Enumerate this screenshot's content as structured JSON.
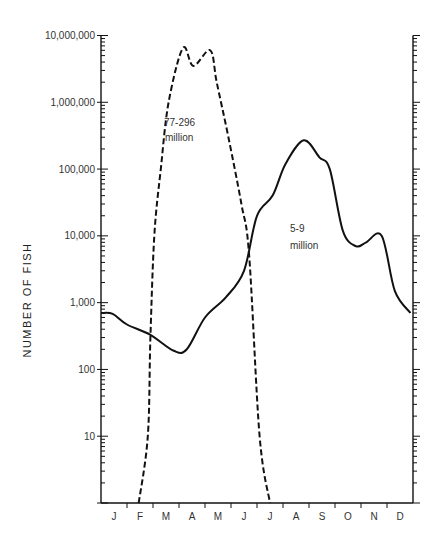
{
  "chart_data": {
    "type": "line",
    "title": "",
    "xlabel": "",
    "ylabel": "NUMBER OF FISH",
    "yscale": "log",
    "ylim": [
      1,
      10000000
    ],
    "y_ticks": [
      "10",
      "100",
      "1,000",
      "10,000",
      "100,000",
      "1,000,000",
      "10,000,000"
    ],
    "x_ticks": [
      "J",
      "F",
      "M",
      "A",
      "M",
      "J",
      "J",
      "A",
      "S",
      "O",
      "N",
      "D"
    ],
    "grid": false,
    "legend": null,
    "annotations": [
      {
        "text_line1": "77-296",
        "text_line2": "million",
        "series": "dashed"
      },
      {
        "text_line1": "5-9",
        "text_line2": "million",
        "series": "solid"
      }
    ],
    "series": [
      {
        "name": "77-296 million (dashed)",
        "style": "dashed",
        "points": [
          {
            "month": 1.45,
            "value": 1
          },
          {
            "month": 1.8,
            "value": 10
          },
          {
            "month": 1.9,
            "value": 300
          },
          {
            "month": 2.05,
            "value": 10000
          },
          {
            "month": 2.3,
            "value": 100000
          },
          {
            "month": 2.6,
            "value": 1000000
          },
          {
            "month": 3.15,
            "value": 6500000
          },
          {
            "month": 3.55,
            "value": 3500000
          },
          {
            "month": 4.2,
            "value": 6000000
          },
          {
            "month": 4.45,
            "value": 2000000
          },
          {
            "month": 4.9,
            "value": 300000
          },
          {
            "month": 5.4,
            "value": 30000
          },
          {
            "month": 5.7,
            "value": 5000
          },
          {
            "month": 6.1,
            "value": 10
          },
          {
            "month": 6.5,
            "value": 1
          }
        ]
      },
      {
        "name": "5-9 million (solid)",
        "style": "solid",
        "points": [
          {
            "month": 0.0,
            "value": 700
          },
          {
            "month": 0.45,
            "value": 680
          },
          {
            "month": 1.0,
            "value": 470
          },
          {
            "month": 1.9,
            "value": 330
          },
          {
            "month": 2.8,
            "value": 190
          },
          {
            "month": 3.3,
            "value": 200
          },
          {
            "month": 4.0,
            "value": 600
          },
          {
            "month": 4.8,
            "value": 1200
          },
          {
            "month": 5.5,
            "value": 3000
          },
          {
            "month": 6.0,
            "value": 20000
          },
          {
            "month": 6.6,
            "value": 40000
          },
          {
            "month": 7.1,
            "value": 120000
          },
          {
            "month": 7.8,
            "value": 270000
          },
          {
            "month": 8.4,
            "value": 150000
          },
          {
            "month": 8.8,
            "value": 100000
          },
          {
            "month": 9.3,
            "value": 12000
          },
          {
            "month": 9.8,
            "value": 7000
          },
          {
            "month": 10.2,
            "value": 8000
          },
          {
            "month": 10.8,
            "value": 10000
          },
          {
            "month": 11.3,
            "value": 1500
          },
          {
            "month": 11.9,
            "value": 700
          }
        ]
      }
    ]
  },
  "labels": {
    "y_axis": "NUMBER OF FISH",
    "annot_dashed_1": "77-296",
    "annot_dashed_2": "million",
    "annot_solid_1": "5-9",
    "annot_solid_2": "million"
  }
}
